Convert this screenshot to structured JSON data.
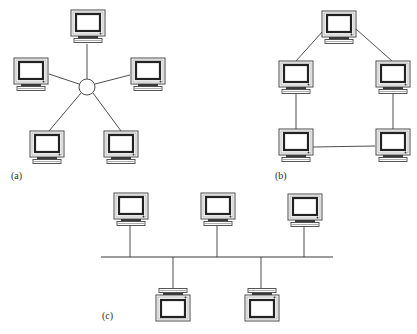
{
  "figure": {
    "colors": {
      "line": "#3a3a3a",
      "background": "#ffffff",
      "screen_border": "#2b2b2b"
    },
    "panels": [
      {
        "id": "a",
        "label": "(a)",
        "topology": "star",
        "hub": {
          "x": 87,
          "y": 87,
          "r": 8
        },
        "nodes": [
          {
            "name": "top",
            "x": 70,
            "y": 9,
            "orientation": "up",
            "link": [
              87,
              45,
              87,
              79
            ]
          },
          {
            "name": "left",
            "x": 13,
            "y": 57,
            "orientation": "up",
            "link": [
              49,
              74,
              80,
              84
            ]
          },
          {
            "name": "right",
            "x": 130,
            "y": 57,
            "orientation": "up",
            "link": [
              130,
              75,
              95,
              85
            ]
          },
          {
            "name": "bottom-left",
            "x": 29,
            "y": 130,
            "orientation": "up",
            "link": [
              49,
              130,
              82,
              94
            ]
          },
          {
            "name": "bottom-right",
            "x": 103,
            "y": 130,
            "orientation": "up",
            "link": [
              121,
              130,
              92,
              94
            ]
          }
        ]
      },
      {
        "id": "b",
        "label": "(b)",
        "topology": "ring",
        "nodes": [
          {
            "name": "top",
            "x": 321,
            "y": 10,
            "orientation": "up"
          },
          {
            "name": "mid-left",
            "x": 278,
            "y": 60,
            "orientation": "up"
          },
          {
            "name": "mid-right",
            "x": 375,
            "y": 60,
            "orientation": "up"
          },
          {
            "name": "bottom-left",
            "x": 278,
            "y": 128,
            "orientation": "up"
          },
          {
            "name": "bottom-right",
            "x": 375,
            "y": 128,
            "orientation": "up"
          }
        ],
        "links": [
          [
            322,
            32,
            297,
            61
          ],
          [
            357,
            30,
            392,
            61
          ],
          [
            296,
            95,
            296,
            129
          ],
          [
            393,
            95,
            393,
            129
          ],
          [
            313,
            147,
            375,
            146
          ]
        ]
      },
      {
        "id": "c",
        "label": "(c)",
        "topology": "bus",
        "bus": {
          "x1": 101,
          "x2": 333,
          "y": 257
        },
        "nodes": [
          {
            "name": "top-1",
            "x": 113,
            "y": 192,
            "orientation": "up",
            "drop_x": 130
          },
          {
            "name": "top-2",
            "x": 200,
            "y": 192,
            "orientation": "up",
            "drop_x": 217
          },
          {
            "name": "top-3",
            "x": 287,
            "y": 193,
            "orientation": "up",
            "drop_x": 304
          },
          {
            "name": "bottom-1",
            "x": 155,
            "y": 286,
            "orientation": "down",
            "drop_x": 173
          },
          {
            "name": "bottom-2",
            "x": 244,
            "y": 286,
            "orientation": "down",
            "drop_x": 261
          }
        ]
      }
    ]
  },
  "labels": {
    "a": {
      "text": "(a)",
      "x": 11,
      "y": 170
    },
    "b": {
      "text": "(b)",
      "x": 275,
      "y": 170
    },
    "c": {
      "text": "(c)",
      "x": 102,
      "y": 310
    }
  }
}
